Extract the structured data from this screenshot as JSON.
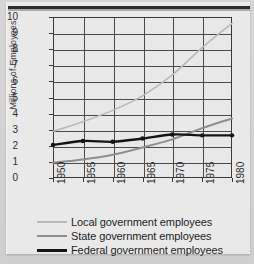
{
  "chart_data": {
    "type": "line",
    "title": "",
    "xlabel": "",
    "ylabel": "Millions of Employees",
    "xlim": [
      1950,
      1980
    ],
    "ylim": [
      0,
      10
    ],
    "grid": true,
    "legend_position": "below",
    "x": [
      1950,
      1955,
      1960,
      1965,
      1970,
      1975,
      1980
    ],
    "xtick_labels": [
      "1950",
      "1955",
      "1960",
      "1965",
      "1970",
      "1975",
      "1980"
    ],
    "ytick_labels": [
      "0",
      "1",
      "2",
      "3",
      "4",
      "5",
      "6",
      "7",
      "8",
      "9",
      "10"
    ],
    "series": [
      {
        "name": "Local government employees",
        "color": "#b9b9b9",
        "width": 1.6,
        "markers": false,
        "values": [
          2.9,
          3.5,
          4.2,
          5.1,
          6.4,
          8.1,
          9.6
        ]
      },
      {
        "name": "State government employees",
        "color": "#8f8f8f",
        "width": 2.0,
        "markers": false,
        "values": [
          0.95,
          1.15,
          1.45,
          1.9,
          2.4,
          3.1,
          3.7
        ]
      },
      {
        "name": "Federal government employees",
        "color": "#141414",
        "width": 2.4,
        "markers": true,
        "values": [
          2.05,
          2.3,
          2.25,
          2.45,
          2.7,
          2.65,
          2.65
        ]
      }
    ]
  },
  "legend": {
    "items": [
      {
        "label": "Local government employees",
        "color": "#b9b9b9",
        "width": 1.6
      },
      {
        "label": "State government employees",
        "color": "#8f8f8f",
        "width": 2.2
      },
      {
        "label": "Federal government employees",
        "color": "#141414",
        "width": 3.0
      }
    ]
  },
  "axes": {
    "y_axis_title": "Millions of Employees"
  }
}
